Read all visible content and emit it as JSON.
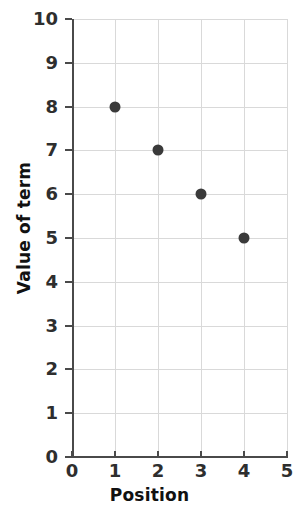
{
  "chart_data": {
    "type": "scatter",
    "title": "",
    "xlabel": "Position",
    "ylabel": "Value of term",
    "x": [
      1,
      2,
      3,
      4
    ],
    "values": [
      8,
      7,
      6,
      5
    ],
    "points": [
      {
        "x": 1,
        "y": 8
      },
      {
        "x": 2,
        "y": 7
      },
      {
        "x": 3,
        "y": 6
      },
      {
        "x": 4,
        "y": 5
      }
    ],
    "xlim": [
      0,
      5
    ],
    "ylim": [
      0,
      10
    ],
    "x_ticks": [
      "0",
      "1",
      "2",
      "3",
      "4",
      "5"
    ],
    "y_ticks": [
      "0",
      "1",
      "2",
      "3",
      "4",
      "5",
      "6",
      "7",
      "8",
      "9",
      "10"
    ],
    "grid": true,
    "legend": null,
    "marker_color": "#3a3a3a",
    "grid_color": "#d9d9d9",
    "axis_color": "#4a4a4a",
    "background_color": "#ffffff"
  }
}
